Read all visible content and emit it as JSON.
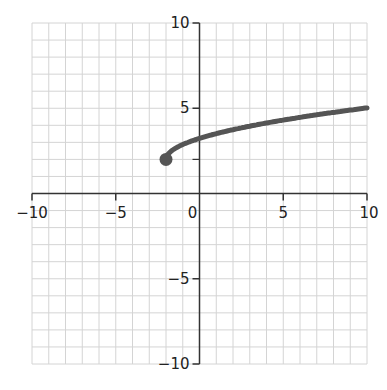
{
  "chart_data": {
    "type": "line",
    "title": "",
    "xlabel": "",
    "ylabel": "",
    "xlim": [
      -10,
      10
    ],
    "ylim": [
      -10,
      10
    ],
    "grid": true,
    "grid_step": 1,
    "x_ticks": [
      -10,
      -5,
      0,
      5,
      10
    ],
    "y_ticks": [
      -10,
      -5,
      5,
      10
    ],
    "x_tick_labels": [
      "−10",
      "−5",
      "0",
      "5",
      "10"
    ],
    "y_tick_labels": [
      "−10",
      "−5",
      "5",
      "10"
    ],
    "series": [
      {
        "name": "f(x)",
        "description": "square-root-shaped curve starting at closed point (-2, 2)",
        "color": "#555555",
        "x": [
          -2,
          -1.5,
          -1,
          0,
          1,
          2,
          3,
          4,
          5,
          6,
          7,
          8,
          9,
          10
        ],
        "y": [
          2.0,
          2.62,
          2.87,
          3.23,
          3.51,
          3.75,
          3.95,
          4.14,
          4.31,
          4.47,
          4.62,
          4.76,
          4.9,
          5.02
        ]
      }
    ],
    "points": [
      {
        "x": -2,
        "y": 2,
        "style": "closed",
        "color": "#555555"
      }
    ]
  }
}
